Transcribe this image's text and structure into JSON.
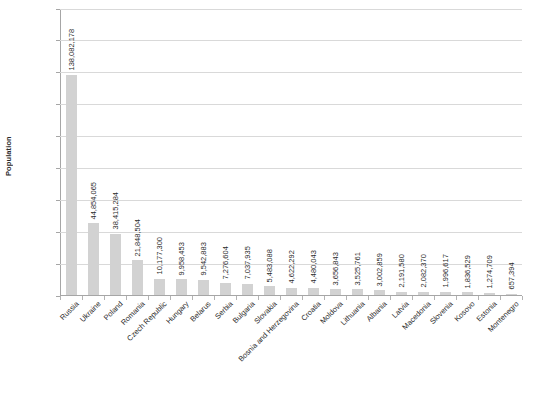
{
  "chart_data": {
    "type": "bar",
    "title": "",
    "xlabel": "",
    "ylabel": "Population",
    "ylim": [
      0,
      180000000
    ],
    "ytick_step": 20000000,
    "grid": true,
    "legend": "none",
    "orientation": "vertical",
    "bar_color": "#d2d2d2",
    "axis_color": "#a6a6a6",
    "gridline_color": "#d9d9d9",
    "categories": [
      "Russia",
      "Ukraine",
      "Poland",
      "Romania",
      "Czech Republic",
      "Hungary",
      "Belarus",
      "Serbia",
      "Bulgaria",
      "Slovakia",
      "Bosnia and Herzegovina",
      "Croatia",
      "Moldova",
      "Lithuania",
      "Albania",
      "Latvia",
      "Macedonia",
      "Slovenia",
      "Kosovo",
      "Estonia",
      "Montenegro"
    ],
    "values": [
      138082178,
      44854065,
      38415284,
      21848504,
      10177300,
      9958453,
      9542883,
      7276604,
      7037935,
      5483088,
      4622292,
      4480043,
      3656843,
      3525761,
      3002859,
      2191580,
      2082370,
      1996617,
      1836529,
      1274709,
      657394
    ],
    "value_labels": [
      "138,082,178",
      "44,854,065",
      "38,415,284",
      "21,848,504",
      "10,177,300",
      "9,958,453",
      "9,542,883",
      "7,276,604",
      "7,037,935",
      "5,483,088",
      "4,622,292",
      "4,480,043",
      "3,656,843",
      "3,525,761",
      "3,002,859",
      "2,191,580",
      "2,082,370",
      "1,996,617",
      "1,836,529",
      "1,274,709",
      "657,394"
    ],
    "ytick_labels": [
      "180,000,000",
      "160,000,000",
      "140,000,000",
      "120,000,000",
      "100,000,000",
      "80,000,000",
      "60,000,000",
      "40,000,000",
      "20,000,000",
      "0"
    ],
    "ytick_values": [
      180000000,
      160000000,
      140000000,
      120000000,
      100000000,
      80000000,
      60000000,
      40000000,
      20000000,
      0
    ]
  }
}
